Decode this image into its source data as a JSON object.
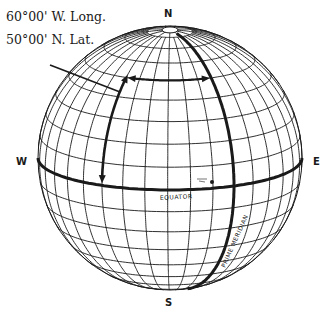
{
  "diagram": {
    "labels": {
      "longitude": "60°00' W. Long.",
      "latitude": "50°00' N. Lat.",
      "north": "N",
      "south": "S",
      "west": "W",
      "east": "E",
      "equator": "EQUATOR",
      "prime_meridian": "PRIME MERIDIAN"
    },
    "globe": {
      "center_x": 170,
      "center_y": 158,
      "radius": 132,
      "tilt_deg": 14,
      "graticule_step_deg": 10,
      "prime_meridian_offset_deg": 29,
      "highlighted_meridian_deg": -60,
      "highlighted_parallel_deg": 50
    },
    "colors": {
      "ink": "#1a1a1a",
      "background": "#ffffff"
    }
  }
}
